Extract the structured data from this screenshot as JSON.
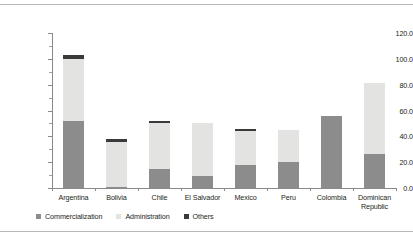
{
  "chart_data": {
    "type": "bar",
    "subtype": "stacked-bar",
    "title": "",
    "xlabel": "",
    "ylabel": "",
    "ylim": [
      0,
      120
    ],
    "ytick_labels": [
      "0.0",
      "20.0",
      "40.0",
      "60.0",
      "80.0",
      "100.0",
      "120.0"
    ],
    "ytick_values": [
      0,
      20,
      40,
      60,
      80,
      100,
      120
    ],
    "yminor_values": [
      10,
      30,
      50,
      70,
      90,
      110
    ],
    "grid": false,
    "legend_position": "bottom-left",
    "categories": [
      "Argentina",
      "Bolivia",
      "Chile",
      "El Salvador",
      "Mexico",
      "Peru",
      "Colombia",
      "Dominican Republic"
    ],
    "series": [
      {
        "name": "Commercialization",
        "color": "#8c8c8c",
        "values": [
          52,
          1,
          15,
          9,
          18,
          20,
          56,
          26
        ]
      },
      {
        "name": "Administration",
        "color": "#e3e3e1",
        "values": [
          48,
          35,
          35,
          41,
          26,
          25,
          0,
          55
        ]
      },
      {
        "name": "Others",
        "color": "#3a3a3a",
        "values": [
          3,
          2,
          2,
          0,
          2,
          0,
          0,
          0
        ]
      }
    ],
    "totals": [
      103,
      38,
      52,
      50,
      46,
      45,
      56,
      81
    ]
  },
  "axis": {
    "line_color": "#8a8a8a",
    "text_color": "#231f20"
  },
  "legend": {
    "items": [
      {
        "label": "Commercialization",
        "color": "#8c8c8c"
      },
      {
        "label": "Administration",
        "color": "#e3e3e1"
      },
      {
        "label": "Others",
        "color": "#3a3a3a"
      }
    ]
  }
}
